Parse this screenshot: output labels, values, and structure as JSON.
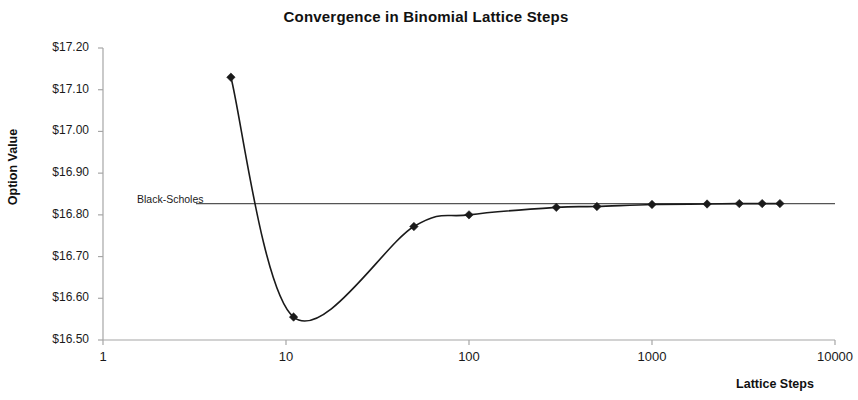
{
  "chart_data": {
    "type": "line",
    "title": "Convergence in Binomial Lattice Steps",
    "xlabel": "Lattice Steps",
    "ylabel": "Option Value",
    "xscale": "log",
    "xlim": [
      1,
      10000
    ],
    "ylim": [
      16.5,
      17.2
    ],
    "grid": false,
    "legend": null,
    "x_tick_labels": [
      "1",
      "10",
      "100",
      "1000",
      "10000"
    ],
    "x_ticks": [
      1,
      10,
      100,
      1000,
      10000
    ],
    "y_tick_labels": [
      "$17.20",
      "$17.10",
      "$17.00",
      "$16.90",
      "$16.80",
      "$16.70",
      "$16.60",
      "$16.50"
    ],
    "y_ticks": [
      17.2,
      17.1,
      17.0,
      16.9,
      16.8,
      16.7,
      16.6,
      16.5
    ],
    "series": [
      {
        "name": "Binomial Lattice Value",
        "marker": "diamond",
        "color": "#1a1a1a",
        "x": [
          5,
          11,
          50,
          100,
          300,
          500,
          1000,
          2000,
          3000,
          4000,
          5000
        ],
        "values": [
          17.13,
          16.555,
          16.772,
          16.8,
          16.818,
          16.82,
          16.825,
          16.826,
          16.827,
          16.827,
          16.827
        ]
      }
    ],
    "annotations": [
      {
        "name": "black-scholes-reference",
        "label": "Black-Scholes",
        "type": "hline",
        "value": 16.827,
        "color": "#555555"
      }
    ]
  }
}
